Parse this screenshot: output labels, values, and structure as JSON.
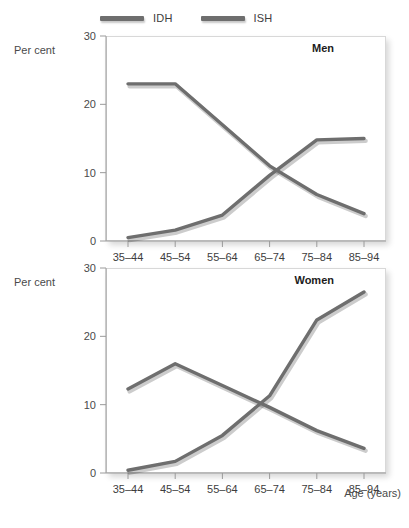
{
  "chart_data": [
    {
      "type": "line",
      "title": "Men",
      "xlabel": "",
      "ylabel": "Per cent",
      "categories": [
        "35–44",
        "45–54",
        "55–64",
        "65–74",
        "75–84",
        "85–94"
      ],
      "ylim": [
        0,
        30
      ],
      "yticks": [
        0,
        10,
        20,
        30
      ],
      "grid": false,
      "legend_position": "top",
      "series": [
        {
          "name": "IDH",
          "values": [
            23.0,
            23.0,
            17.0,
            11.0,
            6.8,
            4.0
          ]
        },
        {
          "name": "ISH",
          "values": [
            0.5,
            1.6,
            3.8,
            9.6,
            14.8,
            15.0
          ]
        }
      ]
    },
    {
      "type": "line",
      "title": "Women",
      "xlabel": "Age (years)",
      "ylabel": "Per cent",
      "categories": [
        "35–44",
        "45–54",
        "55–64",
        "65–74",
        "75–84",
        "85–94"
      ],
      "ylim": [
        0,
        30
      ],
      "yticks": [
        0,
        10,
        20,
        30
      ],
      "grid": false,
      "legend_position": "top",
      "series": [
        {
          "name": "IDH",
          "values": [
            12.3,
            16.0,
            12.8,
            9.6,
            6.2,
            3.6
          ]
        },
        {
          "name": "ISH",
          "values": [
            0.4,
            1.7,
            5.5,
            11.3,
            22.4,
            26.5
          ]
        }
      ]
    }
  ],
  "legend": {
    "items": [
      {
        "label": "IDH",
        "color": "#6e6e6e"
      },
      {
        "label": "ISH",
        "color": "#6e6e6e"
      }
    ]
  },
  "panels": {
    "men": {
      "title": "Men",
      "ylabel": "Per cent",
      "ytick_labels": [
        "30",
        "20",
        "10",
        "0"
      ],
      "xtick_labels": [
        "35–44",
        "45–54",
        "55–64",
        "65–74",
        "75–84",
        "85–94"
      ]
    },
    "women": {
      "title": "Women",
      "ylabel": "Per cent",
      "ytick_labels": [
        "30",
        "20",
        "10",
        "0"
      ],
      "xtick_labels": [
        "35–44",
        "45–54",
        "55–64",
        "65–74",
        "75–84",
        "85–94"
      ],
      "xaxis_title": "Age (years)"
    }
  },
  "colors": {
    "line": "#6e6e6e",
    "frame": "#d8d8d8",
    "axis": "#9a9a9a",
    "text": "#4a4a4a",
    "title_text": "#1c1c1c",
    "background": "#ffffff"
  }
}
